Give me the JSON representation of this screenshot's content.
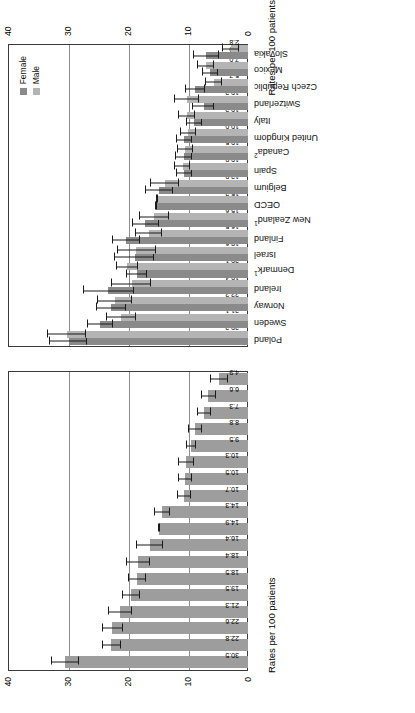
{
  "chart_data": [
    {
      "id": "left",
      "type": "bar",
      "title": "",
      "xlabel": "",
      "ylabel": "Rates per 100 patients",
      "ylim": [
        0,
        40
      ],
      "yticks": [
        0,
        10,
        20,
        30,
        40
      ],
      "grid": true,
      "legend": null,
      "error_bars": true,
      "categories": [
        "Poland",
        "Sweden",
        "Norway",
        "Ireland",
        "Denmark",
        "Israel",
        "Finland",
        "New Zealand",
        "OECD",
        "Belgium",
        "Spain",
        "Canada",
        "United Kingdom",
        "Italy",
        "Switzerland",
        "Czech Republic",
        "Mexico",
        "Slovakia"
      ],
      "values": [
        30.5,
        22.8,
        22.6,
        21.3,
        19.5,
        18.5,
        18.5,
        18.4,
        16.4,
        14.9,
        14.3,
        10.7,
        10.5,
        10.3,
        9.5,
        8.8,
        7.3,
        6.6,
        4.9
      ],
      "series": [
        {
          "name": "Total",
          "values": [
            30.5,
            22.8,
            22.6,
            21.3,
            19.5,
            18.5,
            18.4,
            16.4,
            14.9,
            14.3,
            10.7,
            10.5,
            10.3,
            9.5,
            8.8,
            7.3,
            6.6,
            4.9
          ],
          "ci_low": [
            28.2,
            21.2,
            20.8,
            19.3,
            18.0,
            17.0,
            16.4,
            14.2,
            14.9,
            13.0,
            9.5,
            9.4,
            9.0,
            8.6,
            7.6,
            6.1,
            5.3,
            3.4
          ],
          "ci_high": [
            32.8,
            24.4,
            24.4,
            23.3,
            21.0,
            20.0,
            20.4,
            18.6,
            14.9,
            15.6,
            11.9,
            11.6,
            11.6,
            10.4,
            10.0,
            8.5,
            7.9,
            6.4
          ]
        }
      ]
    },
    {
      "id": "right",
      "type": "bar",
      "title": "",
      "xlabel": "",
      "ylabel": "Rates per 100 patients",
      "ylim": [
        0,
        40
      ],
      "yticks": [
        0,
        10,
        20,
        30,
        40
      ],
      "grid": true,
      "error_bars": true,
      "legend": {
        "position": "top-right",
        "entries": [
          "Female",
          "Male"
        ]
      },
      "categories": [
        "Poland",
        "Sweden",
        "Norway",
        "Ireland",
        "Denmark",
        "Israel",
        "Finland",
        "New Zealand",
        "OECD",
        "Belgium",
        "Spain",
        "Canada",
        "United Kingdom",
        "Italy",
        "Switzerland",
        "Czech Republic",
        "Mexico",
        "Slovakia"
      ],
      "series": [
        {
          "name": "Female",
          "values": [
            29.9,
            24.6,
            22.8,
            23.3,
            18.5,
            18.9,
            20.3,
            17.1,
            15.3,
            14.8,
            10.6,
            10.7,
            10.6,
            9.0,
            7.4,
            8.8,
            6.3,
            7.0
          ],
          "ci_low": [
            26.8,
            22.5,
            20.4,
            19.0,
            16.8,
            15.6,
            18.0,
            14.9,
            15.3,
            12.5,
            9.3,
            9.4,
            9.3,
            7.7,
            5.6,
            7.2,
            5.0,
            4.9
          ],
          "ci_high": [
            33.1,
            26.8,
            25.3,
            27.5,
            20.3,
            22.3,
            22.6,
            19.4,
            15.3,
            17.2,
            12.0,
            12.1,
            12.0,
            10.4,
            9.3,
            10.5,
            7.7,
            9.2
          ]
        },
        {
          "name": "Male",
          "values": [
            30.2,
            21.1,
            22.2,
            19.4,
            20.1,
            18.6,
            16.5,
            15.6,
            15.2,
            13.9,
            10.9,
            10.5,
            10.0,
            10.2,
            10.2,
            5.7,
            7.0,
            2.8
          ],
          "ci_low": [
            27.0,
            18.7,
            19.4,
            16.1,
            18.3,
            15.4,
            14.3,
            13.1,
            15.2,
            11.5,
            9.6,
            9.2,
            8.7,
            8.8,
            8.1,
            4.4,
            5.6,
            1.5
          ],
          "ci_high": [
            33.5,
            23.6,
            25.1,
            22.8,
            22.0,
            21.9,
            18.8,
            18.2,
            15.2,
            16.4,
            12.3,
            11.9,
            11.4,
            11.7,
            12.4,
            7.1,
            8.5,
            4.3
          ]
        }
      ],
      "footnotes": {
        "Denmark": "1",
        "New Zealand": "1",
        "Canada": "2"
      }
    }
  ],
  "axis": {
    "title": "Rates per 100 patients",
    "ticks": [
      "0",
      "10",
      "20",
      "30",
      "40"
    ]
  },
  "legend": {
    "female_label": "Female",
    "male_label": "Male",
    "female_color": "#8a8a8a",
    "male_color": "#b4b4b4"
  },
  "labels": {
    "poland": "Poland",
    "sweden": "Sweden",
    "norway": "Norway",
    "ireland": "Ireland",
    "denmark": "Denmark",
    "israel": "Israel",
    "finland": "Finland",
    "new_zealand": "New Zealand",
    "oecd": "OECD",
    "belgium": "Belgium",
    "spain": "Spain",
    "canada": "Canada",
    "united_kingdom": "United Kingdom",
    "italy": "Italy",
    "switzerland": "Switzerland",
    "czech_republic": "Czech Republic",
    "mexico": "Mexico",
    "slovakia": "Slovakia"
  }
}
